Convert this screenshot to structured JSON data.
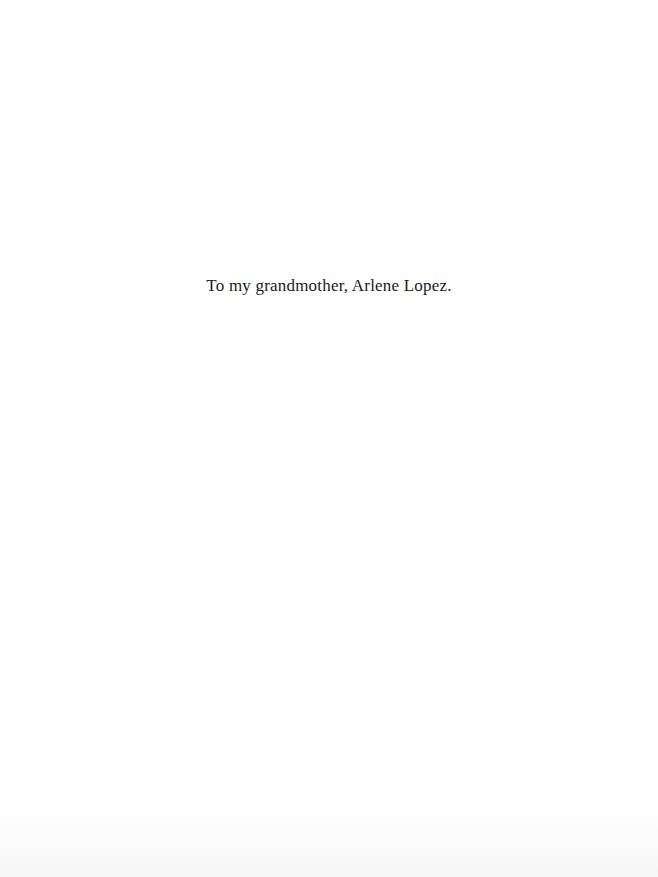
{
  "page": {
    "dedication": "To my grandmother, Arlene Lopez."
  },
  "colors": {
    "background": "#ffffff",
    "text": "#1a1a1a"
  }
}
